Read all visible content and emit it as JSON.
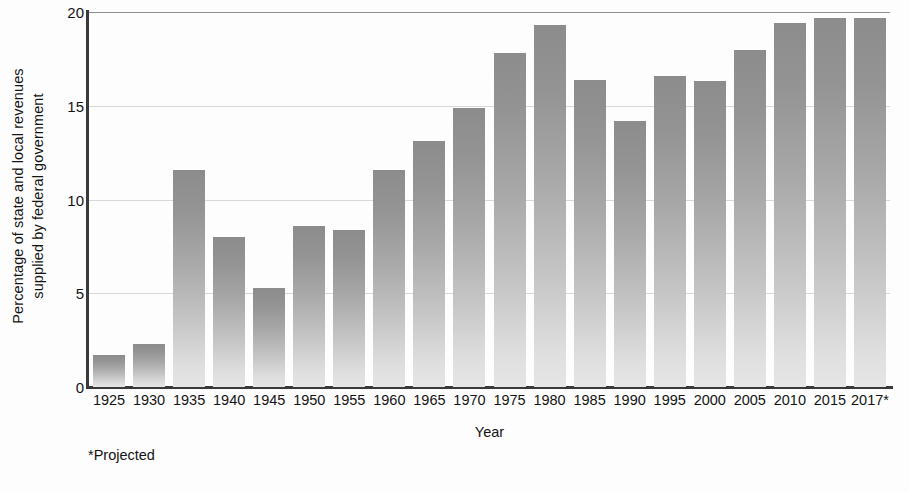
{
  "chart_data": {
    "type": "bar",
    "title": "",
    "xlabel": "Year",
    "ylabel": "Percentage of state and local revenues supplied by federal government",
    "ylabel_lines": [
      "Percentage of state and local revenues",
      "supplied by federal government"
    ],
    "categories": [
      "1925",
      "1930",
      "1935",
      "1940",
      "1945",
      "1950",
      "1955",
      "1960",
      "1965",
      "1970",
      "1975",
      "1980",
      "1985",
      "1990",
      "1995",
      "2000",
      "2005",
      "2010",
      "2015",
      "2017*"
    ],
    "values": [
      1.7,
      2.3,
      11.6,
      8.0,
      5.3,
      8.6,
      8.4,
      11.6,
      13.1,
      14.9,
      17.8,
      19.3,
      16.4,
      14.2,
      16.6,
      16.3,
      18.0,
      19.4,
      19.7,
      19.7
    ],
    "ylim": [
      0,
      20
    ],
    "yticks": [
      0,
      5,
      10,
      15,
      20
    ],
    "ytick_labels": [
      "0",
      "5",
      "10",
      "15",
      "20"
    ],
    "grid": "horizontal",
    "legend": "none",
    "bar_color_top": "#8c8c8c",
    "bar_color_bottom": "#e6e6e6",
    "axis_color": "#3a3a3a",
    "gridline_color": "#d8d8d8"
  },
  "footnote": "*Projected"
}
